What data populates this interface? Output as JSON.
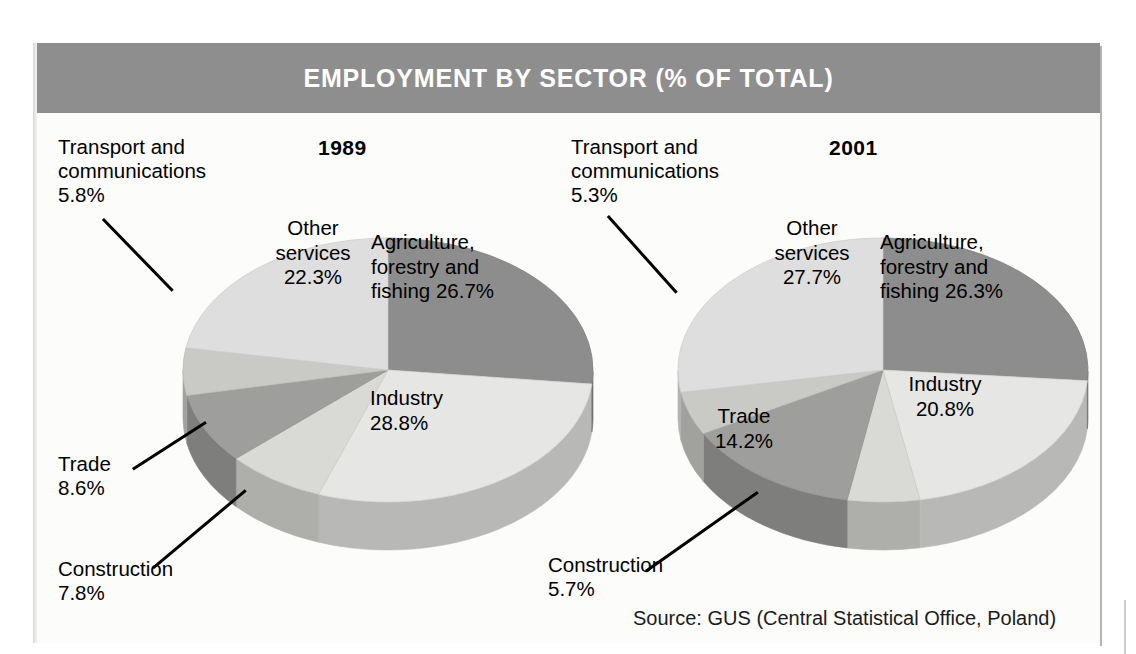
{
  "header": {
    "title": "EMPLOYMENT BY SECTOR (% OF TOTAL)",
    "banner_color": "#8e8e8e",
    "title_color": "#ffffff"
  },
  "source": {
    "text": "Source: GUS (Central Statistical Office, Poland)"
  },
  "charts": {
    "left": {
      "year": "1989",
      "labels": {
        "agriculture": "Agriculture,\nforestry and\nfishing 26.7%",
        "industry": "Industry\n28.8%",
        "other_services": "Other\nservices\n22.3%",
        "transport": "Transport and\ncommunications\n5.8%",
        "trade": "Trade\n8.6%",
        "construction": "Construction\n7.8%"
      }
    },
    "right": {
      "year": "2001",
      "labels": {
        "agriculture": "Agriculture,\nforestry and\nfishing 26.3%",
        "industry": "Industry\n20.8%",
        "other_services": "Other\nservices\n27.7%",
        "transport": "Transport and\ncommunications\n5.3%",
        "trade": "Trade\n14.2%",
        "construction": "Construction\n5.7%"
      }
    }
  },
  "chart_data": [
    {
      "type": "pie",
      "title": "1989",
      "chart_title": "EMPLOYMENT BY SECTOR (% OF TOTAL)",
      "unit": "% of total employment",
      "categories": [
        "Agriculture, forestry and fishing",
        "Industry",
        "Construction",
        "Trade",
        "Transport and communications",
        "Other services"
      ],
      "values": [
        26.7,
        28.8,
        7.8,
        8.6,
        5.8,
        22.3
      ],
      "colors": [
        "#8d8d8d",
        "#e6e6e4",
        "#d9d9d6",
        "#9e9e9c",
        "#c9c9c6",
        "#dedede"
      ],
      "legend": "labels on slices",
      "source": "GUS (Central Statistical Office, Poland)"
    },
    {
      "type": "pie",
      "title": "2001",
      "chart_title": "EMPLOYMENT BY SECTOR (% OF TOTAL)",
      "unit": "% of total employment",
      "categories": [
        "Agriculture, forestry and fishing",
        "Industry",
        "Construction",
        "Trade",
        "Transport and communications",
        "Other services"
      ],
      "values": [
        26.3,
        20.8,
        5.7,
        14.2,
        5.3,
        27.7
      ],
      "colors": [
        "#8d8d8d",
        "#e6e6e4",
        "#d9d9d6",
        "#9e9e9c",
        "#c9c9c6",
        "#dedede"
      ],
      "legend": "labels on slices",
      "source": "GUS (Central Statistical Office, Poland)"
    }
  ]
}
